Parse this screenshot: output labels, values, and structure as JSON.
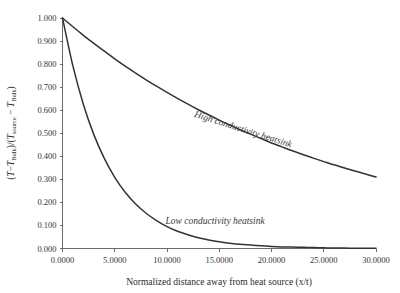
{
  "chart_data": {
    "type": "line",
    "title": "",
    "xlabel": "Normalized distance away from heat source (x/t)",
    "ylabel_parts": {
      "full": "(T−T_Bulk)/(T_source − T_Bulk)",
      "t1": "(T",
      "minus1": "−",
      "t2": "T",
      "sub1": "Bulk",
      "slash": ")/(",
      "t3": "T",
      "sub2": "source",
      "minus2": "−",
      "t4": "T",
      "sub3": "Bulk",
      "close": ")"
    },
    "xlim": [
      0,
      30
    ],
    "ylim": [
      0,
      1
    ],
    "grid": false,
    "legend": "inline-annotations",
    "xticks": [
      0,
      5,
      10,
      15,
      20,
      25,
      30
    ],
    "xticklabels": [
      "0.0000",
      "5.0000",
      "10.0000",
      "15.0000",
      "20.0000",
      "25.0000",
      "30.0000"
    ],
    "yticks": [
      0,
      0.1,
      0.2,
      0.3,
      0.4,
      0.5,
      0.6,
      0.7,
      0.8,
      0.9,
      1.0
    ],
    "yticklabels": [
      "0.000",
      "0.100",
      "0.200",
      "0.300",
      "0.400",
      "0.500",
      "0.600",
      "0.700",
      "0.800",
      "0.900",
      "1.000"
    ],
    "series": [
      {
        "name": "High conductivity heatsink",
        "annotation": "High conductivity heatsink",
        "annotation_x": 17.2,
        "annotation_y": 0.505,
        "annotation_rotation": 17.5,
        "color": "#333333",
        "decay_rate": 0.039,
        "x": [
          0,
          1,
          2,
          3,
          4,
          5,
          6,
          7,
          8,
          9,
          10,
          11,
          12,
          13,
          14,
          15,
          16,
          17,
          18,
          19,
          20,
          21,
          22,
          23,
          24,
          25,
          26,
          27,
          28,
          29,
          30
        ],
        "values": [
          1.0,
          0.962,
          0.925,
          0.89,
          0.856,
          0.823,
          0.791,
          0.761,
          0.732,
          0.704,
          0.677,
          0.651,
          0.626,
          0.602,
          0.579,
          0.557,
          0.536,
          0.515,
          0.496,
          0.477,
          0.458,
          0.441,
          0.424,
          0.408,
          0.392,
          0.377,
          0.363,
          0.349,
          0.336,
          0.323,
          0.31
        ]
      },
      {
        "name": "Low conductivity heatsink",
        "annotation": "Low conductivity heatsink",
        "annotation_x": 14.6,
        "annotation_y": 0.105,
        "annotation_rotation": 0,
        "color": "#333333",
        "decay_rate": 0.235,
        "x": [
          0,
          1,
          2,
          3,
          4,
          5,
          6,
          7,
          8,
          9,
          10,
          11,
          12,
          13,
          14,
          15,
          16,
          17,
          18,
          19,
          20,
          21,
          22,
          23,
          24,
          25,
          26,
          27,
          28,
          29,
          30
        ],
        "values": [
          1.0,
          0.791,
          0.625,
          0.494,
          0.391,
          0.309,
          0.244,
          0.193,
          0.153,
          0.121,
          0.095,
          0.075,
          0.06,
          0.047,
          0.037,
          0.029,
          0.023,
          0.018,
          0.015,
          0.012,
          0.009,
          0.007,
          0.006,
          0.005,
          0.004,
          0.003,
          0.002,
          0.002,
          0.001,
          0.001,
          0.001
        ]
      }
    ]
  },
  "figure": {
    "background": "#ffffff",
    "axis_color": "#6b6b6b",
    "text_color": "#333333"
  }
}
